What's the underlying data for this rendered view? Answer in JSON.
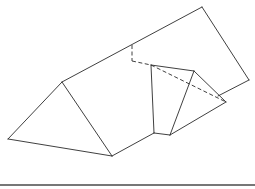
{
  "diagram": {
    "type": "geometric-net-line-drawing",
    "colors": {
      "stroke": "#2a2a2a",
      "background": "#ffffff",
      "rule": "#4a4a4a"
    },
    "solid_edges": [
      {
        "id": "left-triangle-left-side",
        "from": [
          62,
          82
        ],
        "to": [
          8,
          139
        ]
      },
      {
        "id": "left-triangle-bottom",
        "from": [
          8,
          139
        ],
        "to": [
          112,
          156
        ]
      },
      {
        "id": "left-triangle-right-side",
        "from": [
          62,
          82
        ],
        "to": [
          112,
          156
        ]
      },
      {
        "id": "long-top-edge",
        "from": [
          62,
          82
        ],
        "to": [
          202,
          7
        ]
      },
      {
        "id": "rectangle-right-side",
        "from": [
          202,
          7
        ],
        "to": [
          249,
          80
        ]
      },
      {
        "id": "rectangle-bottom-right",
        "from": [
          249,
          80
        ],
        "to": [
          218,
          96
        ]
      },
      {
        "id": "base-lower-edge",
        "from": [
          112,
          156
        ],
        "to": [
          154,
          133
        ]
      },
      {
        "id": "notch-bottom",
        "from": [
          154,
          133
        ],
        "to": [
          170,
          135
        ]
      },
      {
        "id": "quad-left-side",
        "from": [
          151,
          65
        ],
        "to": [
          154,
          133
        ]
      },
      {
        "id": "quad-top",
        "from": [
          151,
          65
        ],
        "to": [
          194,
          71
        ]
      },
      {
        "id": "kite-inner-edge",
        "from": [
          194,
          71
        ],
        "to": [
          170,
          135
        ]
      },
      {
        "id": "kite-upper-right",
        "from": [
          194,
          71
        ],
        "to": [
          226,
          102
        ]
      },
      {
        "id": "kite-lower-right",
        "from": [
          170,
          135
        ],
        "to": [
          226,
          102
        ]
      }
    ],
    "dashed_edges": [
      {
        "id": "hidden-vertical",
        "from": [
          132,
          45
        ],
        "to": [
          132,
          61
        ]
      },
      {
        "id": "hidden-horizontal",
        "from": [
          132,
          61
        ],
        "to": [
          151,
          65
        ]
      },
      {
        "id": "hidden-diagonal",
        "from": [
          151,
          65
        ],
        "to": [
          226,
          102
        ]
      }
    ],
    "rule": {
      "from": [
        0,
        185
      ],
      "to": [
        255,
        185
      ]
    }
  }
}
